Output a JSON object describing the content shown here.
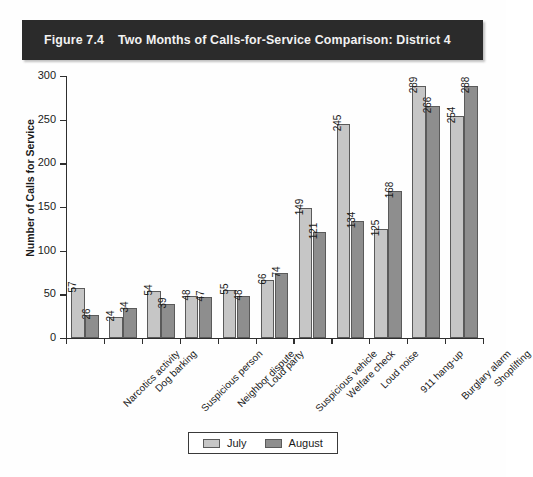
{
  "figure": {
    "number": "Figure 7.4",
    "title": "Two Months of Calls-for-Service Comparison: District 4",
    "title_band_color": "#2b2b2b",
    "title_text_color": "#f2f2f2"
  },
  "legend": {
    "items": [
      {
        "label": "July",
        "color": "#c6c6c6",
        "swatch_name": "legend-swatch-july"
      },
      {
        "label": "August",
        "color": "#8e8e8e",
        "swatch_name": "legend-swatch-august"
      }
    ]
  },
  "chart_data": {
    "type": "bar",
    "xlabel": "",
    "ylabel": "Number of Calls for Service",
    "ylim": [
      0,
      300
    ],
    "yticks": [
      0,
      50,
      100,
      150,
      200,
      250,
      300
    ],
    "ytick_labels": [
      "0",
      "50",
      "100",
      "150",
      "200",
      "250",
      "300"
    ],
    "grid": false,
    "legend_position": "bottom-center",
    "bar_labels_shown": true,
    "bar_label_rotation": -90,
    "category_label_rotation": -45,
    "categories": [
      "Narcotics activity",
      "Dog barking",
      "Suspicious person",
      "Neighbor dispute",
      "Loud party",
      "Suspicious vehicle",
      "Welfare check",
      "Loud noise",
      "911 hang-up",
      "Burglary alarm",
      "Shoplifting"
    ],
    "series": [
      {
        "name": "July",
        "color": "#c6c6c6",
        "values": [
          57,
          24,
          54,
          48,
          55,
          66,
          149,
          245,
          125,
          289,
          254
        ]
      },
      {
        "name": "August",
        "color": "#8e8e8e",
        "values": [
          26,
          34,
          39,
          47,
          48,
          74,
          121,
          134,
          168,
          266,
          288
        ]
      }
    ]
  }
}
